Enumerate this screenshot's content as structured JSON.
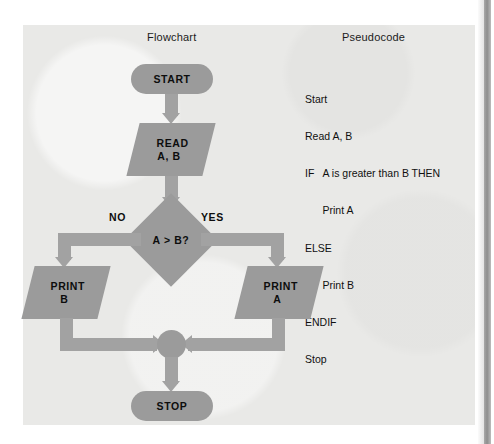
{
  "figure": {
    "columns": {
      "flowchart_title": "Flowchart",
      "pseudocode_title": "Pseudocode"
    },
    "colors": {
      "page_background": "#ffffff",
      "panel_background": "#e9e9e7",
      "shape_fill": "#9b9b9b",
      "connector_fill": "#a2a2a2",
      "text": "#0d0d0d",
      "edge_strip": "#8e8e8e"
    }
  },
  "pseudocode": {
    "lines": [
      "Start",
      "Read A, B",
      "IF   A is greater than B THEN",
      "      Print A",
      "ELSE",
      "      Print B",
      "ENDIF",
      "Stop"
    ]
  },
  "flowchart": {
    "nodes": {
      "start": {
        "label": "START",
        "shape": "terminal"
      },
      "read": {
        "line1": "READ",
        "line2": "A, B",
        "shape": "parallelogram"
      },
      "decision": {
        "label": "A > B?",
        "shape": "diamond"
      },
      "print_b": {
        "line1": "PRINT",
        "line2": "B",
        "shape": "parallelogram"
      },
      "print_a": {
        "line1": "PRINT",
        "line2": "A",
        "shape": "parallelogram"
      },
      "merge": {
        "label": "",
        "shape": "connector-circle"
      },
      "stop": {
        "label": "STOP",
        "shape": "terminal"
      }
    },
    "branch_labels": {
      "no": "NO",
      "yes": "YES"
    }
  }
}
